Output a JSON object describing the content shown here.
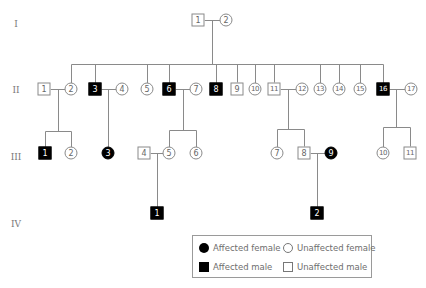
{
  "generations": [
    {
      "label": "I",
      "x": 16,
      "y": 24
    },
    {
      "label": "II",
      "x": 16,
      "y": 90
    },
    {
      "label": "III",
      "x": 16,
      "y": 157
    },
    {
      "label": "IV",
      "x": 16,
      "y": 224
    }
  ],
  "individuals": [
    {
      "id": "I-1",
      "label": "1",
      "sex": "male",
      "affected": false,
      "x": 198,
      "y": 20
    },
    {
      "id": "I-2",
      "label": "2",
      "sex": "female",
      "affected": false,
      "x": 226,
      "y": 20
    },
    {
      "id": "II-1",
      "label": "1",
      "sex": "male",
      "affected": false,
      "x": 44,
      "y": 89
    },
    {
      "id": "II-2",
      "label": "2",
      "sex": "female",
      "affected": false,
      "x": 71,
      "y": 89
    },
    {
      "id": "II-3",
      "label": "3",
      "sex": "male",
      "affected": true,
      "x": 95,
      "y": 89
    },
    {
      "id": "II-4",
      "label": "4",
      "sex": "female",
      "affected": false,
      "x": 122,
      "y": 89
    },
    {
      "id": "II-5",
      "label": "5",
      "sex": "female",
      "affected": false,
      "x": 147,
      "y": 89
    },
    {
      "id": "II-6",
      "label": "6",
      "sex": "male",
      "affected": true,
      "x": 169,
      "y": 89
    },
    {
      "id": "II-7",
      "label": "7",
      "sex": "female",
      "affected": false,
      "x": 196,
      "y": 89
    },
    {
      "id": "II-8",
      "label": "8",
      "sex": "male",
      "affected": true,
      "x": 216,
      "y": 89
    },
    {
      "id": "II-9",
      "label": "9",
      "sex": "male",
      "affected": false,
      "x": 237,
      "y": 89
    },
    {
      "id": "II-10",
      "label": "10",
      "sex": "female",
      "affected": false,
      "x": 255,
      "y": 89
    },
    {
      "id": "II-11",
      "label": "11",
      "sex": "male",
      "affected": false,
      "x": 274,
      "y": 89
    },
    {
      "id": "II-12",
      "label": "12",
      "sex": "female",
      "affected": false,
      "x": 302,
      "y": 89
    },
    {
      "id": "II-13",
      "label": "13",
      "sex": "female",
      "affected": false,
      "x": 320,
      "y": 89
    },
    {
      "id": "II-14",
      "label": "14",
      "sex": "female",
      "affected": false,
      "x": 339,
      "y": 89
    },
    {
      "id": "II-15",
      "label": "15",
      "sex": "female",
      "affected": false,
      "x": 360,
      "y": 89
    },
    {
      "id": "II-16",
      "label": "16",
      "sex": "male",
      "affected": true,
      "x": 383,
      "y": 89
    },
    {
      "id": "II-17",
      "label": "17",
      "sex": "female",
      "affected": false,
      "x": 411,
      "y": 89
    },
    {
      "id": "III-1",
      "label": "1",
      "sex": "male",
      "affected": true,
      "x": 45,
      "y": 153
    },
    {
      "id": "III-2",
      "label": "2",
      "sex": "female",
      "affected": false,
      "x": 71,
      "y": 153
    },
    {
      "id": "III-3",
      "label": "3",
      "sex": "female",
      "affected": true,
      "x": 108,
      "y": 153
    },
    {
      "id": "III-4",
      "label": "4",
      "sex": "male",
      "affected": false,
      "x": 144,
      "y": 153
    },
    {
      "id": "III-5",
      "label": "5",
      "sex": "female",
      "affected": false,
      "x": 169,
      "y": 153
    },
    {
      "id": "III-6",
      "label": "6",
      "sex": "female",
      "affected": false,
      "x": 196,
      "y": 153
    },
    {
      "id": "III-7",
      "label": "7",
      "sex": "female",
      "affected": false,
      "x": 277,
      "y": 153
    },
    {
      "id": "III-8",
      "label": "8",
      "sex": "male",
      "affected": false,
      "x": 304,
      "y": 153
    },
    {
      "id": "III-9",
      "label": "9",
      "sex": "female",
      "affected": true,
      "x": 331,
      "y": 153
    },
    {
      "id": "III-10",
      "label": "10",
      "sex": "female",
      "affected": false,
      "x": 383,
      "y": 153
    },
    {
      "id": "III-11",
      "label": "11",
      "sex": "male",
      "affected": false,
      "x": 410,
      "y": 153
    },
    {
      "id": "IV-1",
      "label": "1",
      "sex": "male",
      "affected": true,
      "x": 157,
      "y": 213
    },
    {
      "id": "IV-2",
      "label": "2",
      "sex": "male",
      "affected": true,
      "x": 317,
      "y": 213
    }
  ],
  "lines": [
    [
      204,
      20,
      220,
      20
    ],
    [
      212,
      20,
      212,
      64
    ],
    [
      71,
      64,
      383,
      64
    ],
    [
      71,
      64,
      71,
      83
    ],
    [
      95,
      64,
      95,
      83
    ],
    [
      147,
      64,
      147,
      83
    ],
    [
      169,
      64,
      169,
      83
    ],
    [
      216,
      64,
      216,
      83
    ],
    [
      237,
      64,
      237,
      83
    ],
    [
      255,
      64,
      255,
      83
    ],
    [
      274,
      64,
      274,
      83
    ],
    [
      320,
      64,
      320,
      83
    ],
    [
      339,
      64,
      339,
      83
    ],
    [
      360,
      64,
      360,
      83
    ],
    [
      383,
      64,
      383,
      83
    ],
    [
      50,
      89,
      65,
      89
    ],
    [
      58,
      89,
      58,
      131
    ],
    [
      45,
      131,
      71,
      131
    ],
    [
      45,
      131,
      45,
      147
    ],
    [
      71,
      131,
      71,
      147
    ],
    [
      101,
      89,
      116,
      89
    ],
    [
      108,
      89,
      108,
      147
    ],
    [
      175,
      89,
      190,
      89
    ],
    [
      183,
      89,
      183,
      130
    ],
    [
      169,
      130,
      196,
      130
    ],
    [
      169,
      130,
      169,
      147
    ],
    [
      196,
      130,
      196,
      147
    ],
    [
      280,
      89,
      296,
      89
    ],
    [
      288,
      89,
      288,
      129
    ],
    [
      277,
      129,
      304,
      129
    ],
    [
      277,
      129,
      277,
      147
    ],
    [
      304,
      129,
      304,
      147
    ],
    [
      389,
      89,
      405,
      89
    ],
    [
      396,
      89,
      396,
      127
    ],
    [
      383,
      127,
      410,
      127
    ],
    [
      383,
      127,
      383,
      147
    ],
    [
      410,
      127,
      410,
      147
    ],
    [
      150,
      153,
      163,
      153
    ],
    [
      157,
      153,
      157,
      207
    ],
    [
      310,
      153,
      325,
      153
    ],
    [
      317,
      153,
      317,
      207
    ]
  ],
  "legend": {
    "items": [
      {
        "symbol": "filled-circle",
        "label": "Affected female",
        "x": 6,
        "y": 8
      },
      {
        "symbol": "open-circle",
        "label": "Unaffected female",
        "x": 93,
        "y": 8
      },
      {
        "symbol": "filled-square",
        "label": "Affected male",
        "x": 6,
        "y": 26
      },
      {
        "symbol": "open-square",
        "label": "Unaffected male",
        "x": 93,
        "y": 26
      }
    ]
  },
  "colors": {
    "affected": "#000000",
    "line": "#8a8a8a",
    "text": "#6e6e6e"
  }
}
